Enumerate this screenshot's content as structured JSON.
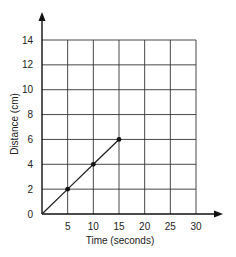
{
  "chart_data": {
    "type": "line",
    "title": "",
    "xlabel": "Time (seconds)",
    "ylabel": "Distance (cm)",
    "xlim": [
      0,
      30
    ],
    "ylim": [
      0,
      14
    ],
    "x_ticks": [
      5,
      10,
      15,
      20,
      25,
      30
    ],
    "y_ticks": [
      0,
      2,
      4,
      6,
      8,
      10,
      12,
      14
    ],
    "grid": true,
    "legend": null,
    "series": [
      {
        "name": "distance",
        "x": [
          0,
          5,
          10,
          15
        ],
        "y": [
          0,
          2,
          4,
          6
        ],
        "markers": [
          [
            5,
            2
          ],
          [
            10,
            4
          ],
          [
            15,
            6
          ]
        ]
      }
    ]
  },
  "colors": {
    "line": "#222222",
    "grid": "#333333",
    "background": "#ffffff"
  }
}
